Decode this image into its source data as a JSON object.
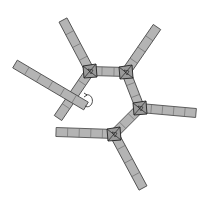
{
  "diagram": {
    "colors": {
      "bar_fill": "#b4b4b4",
      "bar_stroke": "#444444",
      "joint_fill": "#9a9a9a",
      "background": "#ffffff"
    },
    "nodes": [
      {
        "id": "n1",
        "x": 90,
        "y": 71
      },
      {
        "id": "n2",
        "x": 126,
        "y": 72
      },
      {
        "id": "n3",
        "x": 140,
        "y": 108
      },
      {
        "id": "n4",
        "x": 114,
        "y": 134
      }
    ],
    "bars": [
      {
        "id": "ring-n1-n2",
        "x1": 90,
        "y1": 71,
        "x2": 126,
        "y2": 72,
        "segments": 3
      },
      {
        "id": "ring-n2-n3",
        "x1": 126,
        "y1": 72,
        "x2": 140,
        "y2": 108,
        "segments": 3
      },
      {
        "id": "ring-n3-n4",
        "x1": 140,
        "y1": 108,
        "x2": 114,
        "y2": 134,
        "segments": 3
      },
      {
        "id": "ring-n1-down",
        "x1": 90,
        "y1": 71,
        "x2": 58,
        "y2": 118,
        "segments": 4
      },
      {
        "id": "arm-n1",
        "x1": 90,
        "y1": 71,
        "x2": 63,
        "y2": 20,
        "segments": 4
      },
      {
        "id": "arm-n2",
        "x1": 126,
        "y1": 72,
        "x2": 157,
        "y2": 27,
        "segments": 4
      },
      {
        "id": "arm-n3",
        "x1": 140,
        "y1": 108,
        "x2": 196,
        "y2": 113,
        "segments": 5
      },
      {
        "id": "arm-n4-down",
        "x1": 114,
        "y1": 134,
        "x2": 143,
        "y2": 188,
        "segments": 4
      },
      {
        "id": "arm-n4-left",
        "x1": 114,
        "y1": 134,
        "x2": 56,
        "y2": 132,
        "segments": 5
      },
      {
        "id": "rotated-bar",
        "x1": 15,
        "y1": 64,
        "x2": 86,
        "y2": 106,
        "segments": 6
      }
    ],
    "rotation_arrow": {
      "cx": 88,
      "cy": 101,
      "rx": 5,
      "ry": 6
    }
  }
}
